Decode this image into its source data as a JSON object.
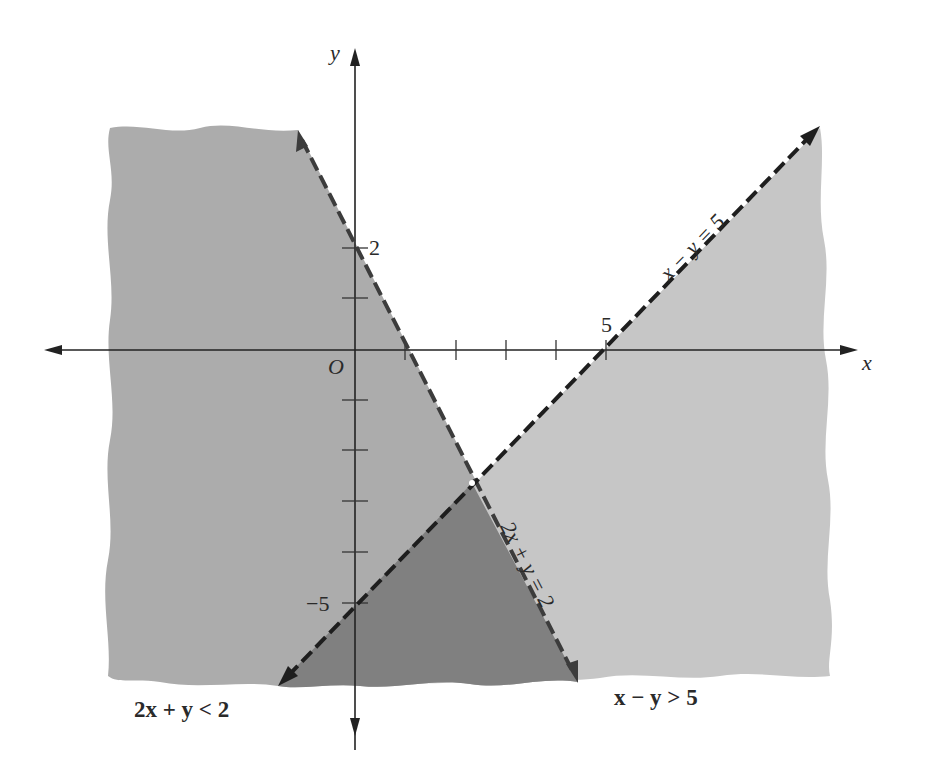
{
  "figure": {
    "type": "graph of system of linear inequalities",
    "axes": {
      "x_label": "x",
      "y_label": "y",
      "origin_label": "O",
      "x_tick_label": "5",
      "y_tick_labels": {
        "positive": "2",
        "negative": "−5"
      },
      "x_ticks": [
        1,
        2,
        3,
        4,
        5
      ],
      "y_ticks": [
        2,
        1,
        -1,
        -2,
        -3,
        -4,
        -5
      ]
    },
    "lines": [
      {
        "label": "x − y = 5",
        "style": "dashed",
        "color": "#222222"
      },
      {
        "label": "2x + y = 2",
        "style": "dashed",
        "color": "#444444"
      }
    ],
    "inequalities": [
      {
        "label": "2x + y < 2",
        "shade": "#a9a9a9"
      },
      {
        "label": "x − y > 5",
        "shade": "#c4c4c4"
      }
    ],
    "overlap_shade": "#7e7e7e",
    "intersection_point": {
      "x": 2.333,
      "y": -2.667
    }
  }
}
